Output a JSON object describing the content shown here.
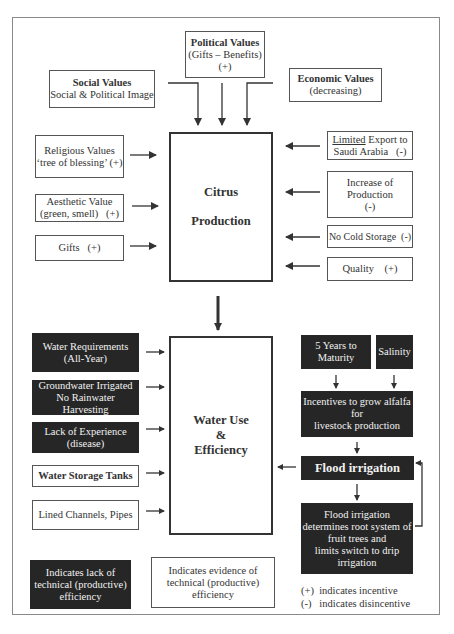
{
  "top": {
    "political": {
      "title": "Political Values",
      "line1": "(Gifts – Benefits)",
      "line2": "(+)"
    },
    "social": {
      "title": "Social Values",
      "line1": "Social & Political Image"
    },
    "economic": {
      "title": "Economic Values",
      "line1": "(decreasing)"
    }
  },
  "citrus": {
    "line1": "Citrus",
    "line2": "Production"
  },
  "citrus_left": [
    {
      "line1": "Religious Values",
      "line2": "‘tree of blessing’ (+)"
    },
    {
      "line1": "Aesthetic Value",
      "line2": "(green, smell)   (+)"
    },
    {
      "line1": "Gifts   (+)"
    }
  ],
  "citrus_right": [
    {
      "underlined": "Limited",
      "line1_rest": " Export to",
      "line2": "Saudi Arabia   (-)"
    },
    {
      "line1": "Increase of",
      "line2": "Production",
      "line3": "(-)"
    },
    {
      "line1": "No Cold Storage  (-)"
    },
    {
      "line1": "Quality    (+)"
    }
  ],
  "water": {
    "line1": "Water Use",
    "line2": "&",
    "line3": "Efficiency"
  },
  "water_left": [
    {
      "line1": "Water Requirements",
      "line2": "(All-Year)",
      "style": "dark"
    },
    {
      "line1": "Groundwater Irrigated",
      "line2": "No Rainwater Harvesting",
      "style": "dark"
    },
    {
      "line1": "Lack of Experience",
      "line2": "(disease)",
      "style": "dark"
    },
    {
      "line1": "Water Storage Tanks",
      "style": "white-bold"
    },
    {
      "line1": "Lined Channels, Pipes",
      "style": "white"
    }
  ],
  "water_right": {
    "maturity": {
      "line1": "5 Years to",
      "line2": "Maturity"
    },
    "salinity": {
      "line1": "Salinity"
    },
    "incentives": {
      "line1": "Incentives to grow alfalfa",
      "line2": "for",
      "line3": "livestock production"
    },
    "flood": {
      "line1": "Flood irrigation"
    },
    "flood_desc": {
      "line1": "Flood irrigation",
      "line2": "determines root system of",
      "line3": "fruit trees and",
      "line4": "limits switch to drip",
      "line5": "irrigation"
    }
  },
  "legend": {
    "dark": {
      "line1": "Indicates lack of",
      "line2": "technical (productive)",
      "line3": "efficiency"
    },
    "white": {
      "line1": "Indicates evidence of",
      "line2": "technical (productive)",
      "line3": "efficiency"
    },
    "plus": "(+)  indicates incentive",
    "minus": "(-)   indicates disincentive"
  },
  "colors": {
    "dark_box": "#262626",
    "border": "#555555",
    "frame": "#8a8a8a",
    "arrow": "#333333"
  }
}
